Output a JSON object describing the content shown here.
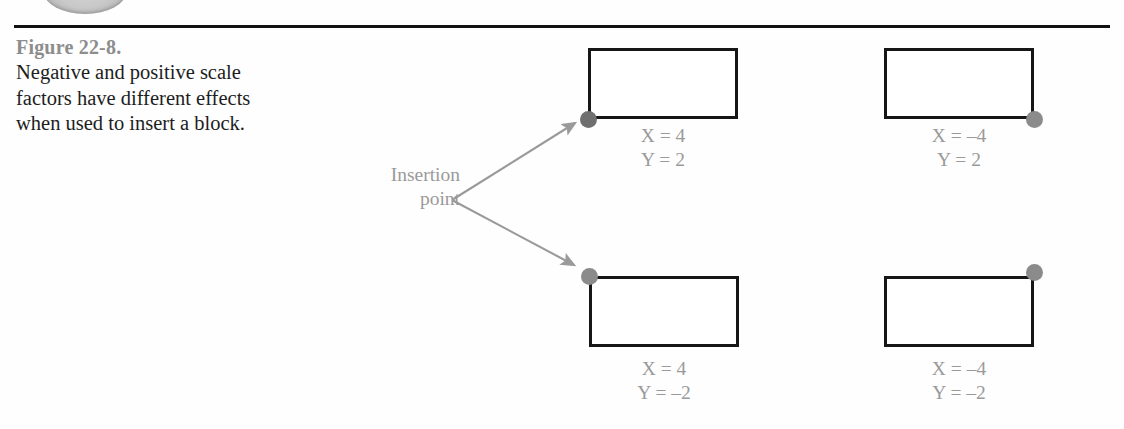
{
  "figure": {
    "title": "Figure 22-8.",
    "caption": "Negative and positive scale factors have different effects when used to insert a block.",
    "rule_color": "#111111",
    "title_color": "#8d8d8d",
    "caption_color": "#1d1d1d"
  },
  "annotation": {
    "insertion_line1": "Insertion",
    "insertion_line2": "point",
    "color": "#9a9a9a"
  },
  "diagram": {
    "rect_stroke_color": "#161616",
    "dot_color": "#8b8b8b",
    "label_color": "#9a9a9a",
    "blocks": [
      {
        "id": "top-left",
        "x_label": "X = 4",
        "y_label": "Y = 2",
        "dot_corner": "bottom-left"
      },
      {
        "id": "top-right",
        "x_label": "X = –4",
        "y_label": "Y = 2",
        "dot_corner": "bottom-right"
      },
      {
        "id": "bottom-left",
        "x_label": "X = 4",
        "y_label": "Y = –2",
        "dot_corner": "top-left"
      },
      {
        "id": "bottom-right",
        "x_label": "X = –4",
        "y_label": "Y = –2",
        "dot_corner": "top-right"
      }
    ]
  }
}
